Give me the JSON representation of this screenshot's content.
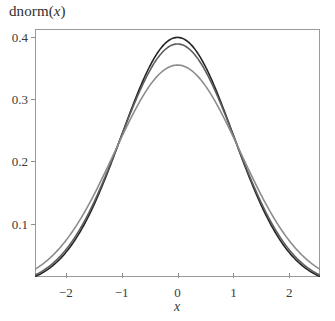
{
  "chart_data": {
    "type": "line",
    "title": "dnorm(x)",
    "title_prefix": "dnorm(",
    "title_variable": "x",
    "title_suffix": ")",
    "xlabel": "x",
    "ylabel": "",
    "xlim": [
      -2.55,
      2.55
    ],
    "ylim": [
      0.0148,
      0.4124
    ],
    "grid": false,
    "legend": "none",
    "xticks": [
      -2,
      -1,
      0,
      1,
      2
    ],
    "xtick_labels": [
      "−2",
      "−1",
      "0",
      "1",
      "2"
    ],
    "yticks": [
      0.1,
      0.2,
      0.3,
      0.4
    ],
    "ytick_labels": [
      "0.1",
      "0.2",
      "0.3",
      "0.4"
    ],
    "series": [
      {
        "name": "curve-1",
        "color": "#242424",
        "peak": 0.3989,
        "mean": 0.0,
        "sigma": 1.0,
        "x": [
          -2.55,
          -2.4,
          -2.2,
          -2.0,
          -1.8,
          -1.6,
          -1.4,
          -1.2,
          -1.0,
          -0.8,
          -0.6,
          -0.4,
          -0.2,
          0.0,
          0.2,
          0.4,
          0.6,
          0.8,
          1.0,
          1.2,
          1.4,
          1.6,
          1.8,
          2.0,
          2.2,
          2.4,
          2.55
        ],
        "values": [
          0.0154,
          0.0224,
          0.0355,
          0.054,
          0.079,
          0.1109,
          0.1497,
          0.1942,
          0.242,
          0.2897,
          0.3332,
          0.3683,
          0.391,
          0.3989,
          0.391,
          0.3683,
          0.3332,
          0.2897,
          0.242,
          0.1942,
          0.1497,
          0.1109,
          0.079,
          0.054,
          0.0355,
          0.0224,
          0.0154
        ]
      },
      {
        "name": "curve-2",
        "color": "#5d5d5d",
        "peak": 0.3884,
        "mean": 0.0,
        "sigma": 1.027,
        "x": [
          -2.55,
          -2.4,
          -2.2,
          -2.0,
          -1.8,
          -1.6,
          -1.4,
          -1.2,
          -1.0,
          -0.8,
          -0.6,
          -0.4,
          -0.2,
          0.0,
          0.2,
          0.4,
          0.6,
          0.8,
          1.0,
          1.2,
          1.4,
          1.6,
          1.8,
          2.0,
          2.2,
          2.4,
          2.55
        ],
        "values": [
          0.0187,
          0.0263,
          0.0402,
          0.0594,
          0.0846,
          0.1161,
          0.1535,
          0.1955,
          0.2399,
          0.2835,
          0.3224,
          0.353,
          0.3723,
          0.3884,
          0.3723,
          0.353,
          0.3224,
          0.2835,
          0.2399,
          0.1955,
          0.1535,
          0.1161,
          0.0846,
          0.0594,
          0.0402,
          0.0263,
          0.0187
        ]
      },
      {
        "name": "curve-3",
        "color": "#8c8c8c",
        "peak": 0.3546,
        "mean": 0.0,
        "sigma": 1.125,
        "x": [
          -2.55,
          -2.4,
          -2.2,
          -2.0,
          -1.8,
          -1.6,
          -1.4,
          -1.2,
          -1.0,
          -0.8,
          -0.6,
          -0.4,
          -0.2,
          0.0,
          0.2,
          0.4,
          0.6,
          0.8,
          1.0,
          1.2,
          1.4,
          1.6,
          1.8,
          2.0,
          2.2,
          2.4,
          2.55
        ],
        "values": [
          0.0286,
          0.0383,
          0.0546,
          0.0758,
          0.1017,
          0.1315,
          0.1637,
          0.1962,
          0.2266,
          0.2526,
          0.2723,
          0.2847,
          0.2893,
          0.3546,
          0.2893,
          0.2847,
          0.2723,
          0.2526,
          0.2266,
          0.1962,
          0.1637,
          0.1315,
          0.1017,
          0.0758,
          0.0546,
          0.0383,
          0.0286
        ]
      }
    ]
  },
  "axes": {
    "frame_color": "#9a9a9a",
    "tick_color": "#8d8d8d",
    "background": "#ffffff"
  }
}
